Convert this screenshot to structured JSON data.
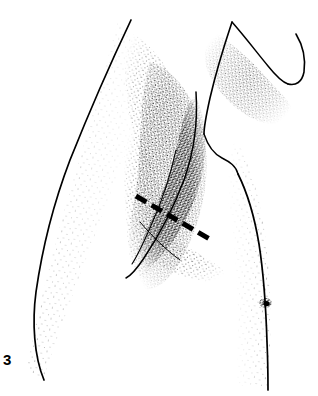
{
  "figure": {
    "label": "3",
    "kind": "medical-line-illustration",
    "technique": "pen-and-ink stipple drawing",
    "caption_visible": false,
    "width_px": 318,
    "height_px": 396
  },
  "colors": {
    "background": "#ffffff",
    "ink": "#000000",
    "stipple": "#1a1a1a",
    "label": "#000000"
  },
  "annotation": {
    "incision_marker": {
      "name": "dashed-incision-line",
      "style": "dashed",
      "color": "#000000",
      "stroke_width_px": 5,
      "dash_count": 6,
      "dash_length_px": 12,
      "gap_length_px": 6,
      "start_point": [
        136,
        196
      ],
      "end_point": [
        213,
        241
      ],
      "angle_deg": 30
    }
  },
  "anatomy": {
    "parts": [
      {
        "name": "upper-arm-lateral-contour",
        "side": "left"
      },
      {
        "name": "upper-arm-medial-contour",
        "side": "left"
      },
      {
        "name": "axillary-hollow",
        "shading": "dense-stipple"
      },
      {
        "name": "anterior-axillary-fold",
        "shading": "dense-stipple"
      },
      {
        "name": "posterior-axillary-fold",
        "shading": "medium-stipple"
      },
      {
        "name": "pectoralis-major-border"
      },
      {
        "name": "shoulder-deltoid-contour",
        "side": "right"
      },
      {
        "name": "neck-contour",
        "side": "right"
      },
      {
        "name": "lateral-chest-wall-contour",
        "side": "right"
      },
      {
        "name": "nipple",
        "position": [
          266,
          303
        ]
      }
    ]
  }
}
